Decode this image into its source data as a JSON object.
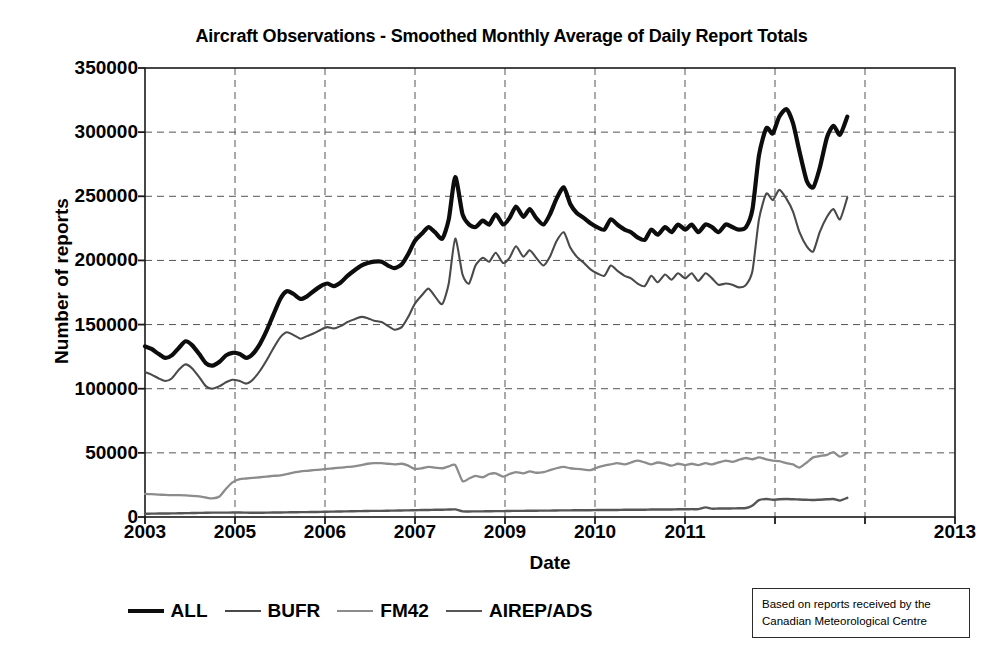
{
  "chart_data": {
    "type": "line",
    "title": "Aircraft Observations - Smoothed Monthly  Average of Daily Report Totals",
    "xlabel": "Date",
    "ylabel": "Number of reports",
    "grid": true,
    "legend_position": "bottom",
    "xlim": [
      2003,
      2013
    ],
    "ylim": [
      0,
      350000
    ],
    "ytick_labels": [
      "350000",
      "300000",
      "250000",
      "200000",
      "150000",
      "100000",
      "50000",
      "0"
    ],
    "ytick_values": [
      350000,
      300000,
      250000,
      200000,
      150000,
      100000,
      50000,
      0
    ],
    "xtick_labels": [
      "2003",
      "2005",
      "2006",
      "2007",
      "2009",
      "2010",
      "2011",
      "2013"
    ],
    "xtick_values": [
      2003,
      2004.111,
      2005.222,
      2006.333,
      2007.444,
      2008.556,
      2009.667,
      2013
    ],
    "annotation": {
      "line1": "Based on reports received by the",
      "line2": "Canadian Meteorological Centre"
    },
    "series": [
      {
        "name": "ALL",
        "color": "#0d0d0d",
        "width": 4.2,
        "x": [
          2003.0,
          2003.08,
          2003.17,
          2003.25,
          2003.33,
          2003.42,
          2003.5,
          2003.58,
          2003.67,
          2003.75,
          2003.83,
          2003.92,
          2004.0,
          2004.08,
          2004.17,
          2004.25,
          2004.33,
          2004.42,
          2004.5,
          2004.58,
          2004.67,
          2004.75,
          2004.83,
          2004.92,
          2005.0,
          2005.08,
          2005.17,
          2005.25,
          2005.33,
          2005.42,
          2005.5,
          2005.58,
          2005.67,
          2005.75,
          2005.83,
          2005.92,
          2006.0,
          2006.08,
          2006.17,
          2006.25,
          2006.33,
          2006.42,
          2006.5,
          2006.58,
          2006.67,
          2006.75,
          2006.83,
          2006.92,
          2007.0,
          2007.08,
          2007.17,
          2007.25,
          2007.33,
          2007.42,
          2007.5,
          2007.58,
          2007.67,
          2007.75,
          2007.83,
          2007.92,
          2008.0,
          2008.08,
          2008.17,
          2008.25,
          2008.33,
          2008.42,
          2008.5,
          2008.58,
          2008.67,
          2008.75,
          2008.83,
          2008.92,
          2009.0,
          2009.08,
          2009.17,
          2009.25,
          2009.33,
          2009.42,
          2009.5,
          2009.58,
          2009.67,
          2009.75,
          2009.83,
          2009.92,
          2010.0,
          2010.08,
          2010.17,
          2010.25,
          2010.33,
          2010.42,
          2010.5,
          2010.58,
          2010.67,
          2010.75,
          2010.83,
          2010.92,
          2011.0,
          2011.08,
          2011.17,
          2011.25,
          2011.33,
          2011.42,
          2011.5,
          2011.58,
          2011.67
        ],
        "y": [
          133000,
          131000,
          127000,
          124000,
          126000,
          132000,
          137000,
          134000,
          127000,
          120000,
          118000,
          121000,
          126000,
          128000,
          127000,
          124000,
          127000,
          135000,
          145000,
          157000,
          170000,
          176000,
          174000,
          170000,
          172000,
          176000,
          180000,
          182000,
          180000,
          183000,
          188000,
          192000,
          196000,
          198000,
          199000,
          199000,
          196000,
          194000,
          197000,
          205000,
          215000,
          221000,
          226000,
          222000,
          217000,
          232000,
          265000,
          236000,
          228000,
          226000,
          231000,
          228000,
          236000,
          228000,
          233000,
          242000,
          234000,
          240000,
          233000,
          228000,
          236000,
          248000,
          257000,
          244000,
          237000,
          233000,
          229000,
          226000,
          224000,
          232000,
          228000,
          224000,
          222000,
          218000,
          216000,
          224000,
          220000,
          226000,
          222000,
          228000,
          224000,
          228000,
          222000,
          228000,
          226000,
          222000,
          228000,
          226000,
          224000,
          226000,
          240000,
          282000,
          303000,
          299000,
          312000,
          318000,
          307000,
          285000,
          262000,
          257000,
          272000,
          296000,
          305000,
          298000,
          312000
        ]
      },
      {
        "name": "BUFR",
        "color": "#4a4a4a",
        "width": 2.1,
        "x": [
          2003.0,
          2003.08,
          2003.17,
          2003.25,
          2003.33,
          2003.42,
          2003.5,
          2003.58,
          2003.67,
          2003.75,
          2003.83,
          2003.92,
          2004.0,
          2004.08,
          2004.17,
          2004.25,
          2004.33,
          2004.42,
          2004.5,
          2004.58,
          2004.67,
          2004.75,
          2004.83,
          2004.92,
          2005.0,
          2005.08,
          2005.17,
          2005.25,
          2005.33,
          2005.42,
          2005.5,
          2005.58,
          2005.67,
          2005.75,
          2005.83,
          2005.92,
          2006.0,
          2006.08,
          2006.17,
          2006.25,
          2006.33,
          2006.42,
          2006.5,
          2006.58,
          2006.67,
          2006.75,
          2006.83,
          2006.92,
          2007.0,
          2007.08,
          2007.17,
          2007.25,
          2007.33,
          2007.42,
          2007.5,
          2007.58,
          2007.67,
          2007.75,
          2007.83,
          2007.92,
          2008.0,
          2008.08,
          2008.17,
          2008.25,
          2008.33,
          2008.42,
          2008.5,
          2008.58,
          2008.67,
          2008.75,
          2008.83,
          2008.92,
          2009.0,
          2009.08,
          2009.17,
          2009.25,
          2009.33,
          2009.42,
          2009.5,
          2009.58,
          2009.67,
          2009.75,
          2009.83,
          2009.92,
          2010.0,
          2010.08,
          2010.17,
          2010.25,
          2010.33,
          2010.42,
          2010.5,
          2010.58,
          2010.67,
          2010.75,
          2010.83,
          2010.92,
          2011.0,
          2011.08,
          2011.17,
          2011.25,
          2011.33,
          2011.42,
          2011.5,
          2011.58,
          2011.67
        ],
        "y": [
          113000,
          111000,
          108000,
          106000,
          108000,
          115000,
          119000,
          116000,
          109000,
          102000,
          100000,
          102000,
          105000,
          107000,
          106000,
          104000,
          107000,
          114000,
          122000,
          131000,
          140000,
          144000,
          142000,
          139000,
          141000,
          143000,
          146000,
          148000,
          147000,
          149000,
          152000,
          154000,
          156000,
          155000,
          153000,
          152000,
          149000,
          146000,
          148000,
          156000,
          166000,
          173000,
          178000,
          172000,
          166000,
          182000,
          217000,
          189000,
          182000,
          196000,
          202000,
          199000,
          206000,
          198000,
          202000,
          211000,
          203000,
          208000,
          202000,
          196000,
          203000,
          215000,
          222000,
          210000,
          203000,
          198000,
          193000,
          190000,
          188000,
          196000,
          192000,
          188000,
          186000,
          182000,
          180000,
          188000,
          183000,
          189000,
          185000,
          190000,
          186000,
          190000,
          184000,
          190000,
          186000,
          181000,
          182000,
          181000,
          179000,
          181000,
          192000,
          232000,
          252000,
          247000,
          255000,
          248000,
          238000,
          222000,
          211000,
          207000,
          222000,
          234000,
          240000,
          232000,
          249000
        ]
      },
      {
        "name": "FM42",
        "color": "#8c8c8c",
        "width": 2.3,
        "x": [
          2003.0,
          2003.08,
          2003.17,
          2003.25,
          2003.33,
          2003.42,
          2003.5,
          2003.58,
          2003.67,
          2003.75,
          2003.83,
          2003.92,
          2004.0,
          2004.08,
          2004.17,
          2004.25,
          2004.33,
          2004.42,
          2004.5,
          2004.58,
          2004.67,
          2004.75,
          2004.83,
          2004.92,
          2005.0,
          2005.08,
          2005.17,
          2005.25,
          2005.33,
          2005.42,
          2005.5,
          2005.58,
          2005.67,
          2005.75,
          2005.83,
          2005.92,
          2006.0,
          2006.08,
          2006.17,
          2006.25,
          2006.33,
          2006.42,
          2006.5,
          2006.58,
          2006.67,
          2006.75,
          2006.83,
          2006.92,
          2007.0,
          2007.08,
          2007.17,
          2007.25,
          2007.33,
          2007.42,
          2007.5,
          2007.58,
          2007.67,
          2007.75,
          2007.83,
          2007.92,
          2008.0,
          2008.08,
          2008.17,
          2008.25,
          2008.33,
          2008.42,
          2008.5,
          2008.58,
          2008.67,
          2008.75,
          2008.83,
          2008.92,
          2009.0,
          2009.08,
          2009.17,
          2009.25,
          2009.33,
          2009.42,
          2009.5,
          2009.58,
          2009.67,
          2009.75,
          2009.83,
          2009.92,
          2010.0,
          2010.08,
          2010.17,
          2010.25,
          2010.33,
          2010.42,
          2010.5,
          2010.58,
          2010.67,
          2010.75,
          2010.83,
          2010.92,
          2011.0,
          2011.08,
          2011.17,
          2011.25,
          2011.33,
          2011.42,
          2011.5,
          2011.58,
          2011.67
        ],
        "y": [
          18000,
          17800,
          17500,
          17200,
          17000,
          17000,
          16800,
          16500,
          16000,
          15200,
          14500,
          16000,
          22000,
          27000,
          29500,
          30000,
          30500,
          31000,
          31500,
          32000,
          32500,
          33500,
          34500,
          35500,
          36000,
          36500,
          37000,
          37500,
          38000,
          38500,
          39000,
          39500,
          40500,
          41500,
          42000,
          42000,
          41500,
          41000,
          41500,
          40000,
          37500,
          38000,
          39000,
          38500,
          38000,
          39500,
          40500,
          28000,
          30000,
          32000,
          31000,
          33500,
          34000,
          31500,
          33500,
          35000,
          34000,
          35500,
          34500,
          35000,
          36500,
          38000,
          39000,
          38000,
          37500,
          37000,
          36500,
          38500,
          40000,
          41000,
          42000,
          41000,
          42500,
          44000,
          42500,
          41000,
          42500,
          41500,
          40000,
          41500,
          40500,
          41500,
          40500,
          42000,
          41000,
          42500,
          44000,
          43000,
          44500,
          46000,
          45000,
          46500,
          45000,
          44000,
          43500,
          42000,
          41000,
          38500,
          42500,
          46500,
          47500,
          48500,
          50500,
          47000,
          50000
        ]
      },
      {
        "name": "AIREP/ADS",
        "color": "#565656",
        "width": 2.4,
        "x": [
          2003.0,
          2003.08,
          2003.17,
          2003.25,
          2003.33,
          2003.42,
          2003.5,
          2003.58,
          2003.67,
          2003.75,
          2003.83,
          2003.92,
          2004.0,
          2004.08,
          2004.17,
          2004.25,
          2004.33,
          2004.42,
          2004.5,
          2004.58,
          2004.67,
          2004.75,
          2004.83,
          2004.92,
          2005.0,
          2005.08,
          2005.17,
          2005.25,
          2005.33,
          2005.42,
          2005.5,
          2005.58,
          2005.67,
          2005.75,
          2005.83,
          2005.92,
          2006.0,
          2006.08,
          2006.17,
          2006.25,
          2006.33,
          2006.42,
          2006.5,
          2006.58,
          2006.67,
          2006.75,
          2006.83,
          2006.92,
          2007.0,
          2007.08,
          2007.17,
          2007.25,
          2007.33,
          2007.42,
          2007.5,
          2007.58,
          2007.67,
          2007.75,
          2007.83,
          2007.92,
          2008.0,
          2008.08,
          2008.17,
          2008.25,
          2008.33,
          2008.42,
          2008.5,
          2008.58,
          2008.67,
          2008.75,
          2008.83,
          2008.92,
          2009.0,
          2009.08,
          2009.17,
          2009.25,
          2009.33,
          2009.42,
          2009.5,
          2009.58,
          2009.67,
          2009.75,
          2009.83,
          2009.92,
          2010.0,
          2010.08,
          2010.17,
          2010.25,
          2010.33,
          2010.42,
          2010.5,
          2010.58,
          2010.67,
          2010.75,
          2010.83,
          2010.92,
          2011.0,
          2011.08,
          2011.17,
          2011.25,
          2011.33,
          2011.42,
          2011.5,
          2011.58,
          2011.67
        ],
        "y": [
          2500,
          2600,
          2700,
          2700,
          2800,
          2900,
          3000,
          3100,
          3200,
          3300,
          3400,
          3400,
          3400,
          3500,
          3500,
          3400,
          3300,
          3300,
          3400,
          3500,
          3500,
          3600,
          3700,
          3800,
          3800,
          3900,
          4000,
          4100,
          4200,
          4300,
          4400,
          4500,
          4600,
          4700,
          4800,
          4800,
          4900,
          5000,
          5100,
          5200,
          5300,
          5400,
          5500,
          5600,
          5700,
          5800,
          5900,
          4400,
          4300,
          4400,
          4400,
          4500,
          4600,
          4600,
          4700,
          4800,
          4800,
          4900,
          4900,
          5000,
          5000,
          5100,
          5200,
          5200,
          5300,
          5300,
          5300,
          5400,
          5400,
          5500,
          5500,
          5600,
          5600,
          5700,
          5700,
          5800,
          5800,
          5900,
          5900,
          6000,
          6000,
          6100,
          6100,
          7500,
          6500,
          6600,
          6600,
          6700,
          6800,
          7000,
          9000,
          13200,
          14000,
          13500,
          13800,
          14000,
          13800,
          13600,
          13400,
          13200,
          13500,
          13800,
          14000,
          12800,
          15000
        ]
      }
    ]
  }
}
